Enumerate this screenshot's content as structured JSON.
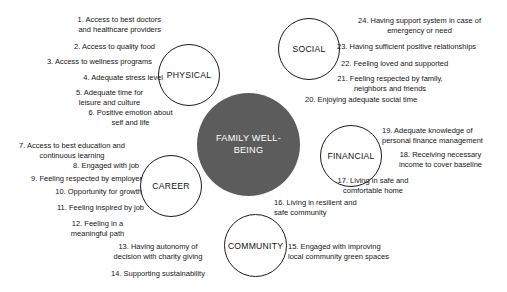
{
  "diagram": {
    "core": {
      "label": "FAMILY WELL-BEING",
      "color": "#5c5c5c",
      "text_color": "#ffffff"
    },
    "categories": [
      {
        "key": "physical",
        "label": "PHYSICAL"
      },
      {
        "key": "social",
        "label": "SOCIAL"
      },
      {
        "key": "financial",
        "label": "FINANCIAL"
      },
      {
        "key": "community",
        "label": "COMMUNITY"
      },
      {
        "key": "career",
        "label": "CAREER"
      }
    ],
    "items": [
      {
        "number": "1",
        "text": "1. Access to best doctors\nand healthcare providers",
        "category": "physical"
      },
      {
        "number": "2",
        "text": "2. Access to quality food",
        "category": "physical"
      },
      {
        "number": "3",
        "text": "3. Access to wellness programs",
        "category": "physical"
      },
      {
        "number": "4",
        "text": "4. Adequate stress level",
        "category": "physical"
      },
      {
        "number": "5",
        "text": "5. Adequate time for\nleisure and culture",
        "category": "physical"
      },
      {
        "number": "6",
        "text": "6. Positive emotion about\nself and life",
        "category": "physical"
      },
      {
        "number": "7",
        "text": "7. Access to best education and\ncontinuous learning",
        "category": "career"
      },
      {
        "number": "8",
        "text": "8. Engaged with job",
        "category": "career"
      },
      {
        "number": "9",
        "text": "9. Feeling respected by employer",
        "category": "career"
      },
      {
        "number": "10",
        "text": "10. Opportunity for growth",
        "category": "career"
      },
      {
        "number": "11",
        "text": "11. Feeling inspired by job",
        "category": "career"
      },
      {
        "number": "12",
        "text": "12. Feeling in a\nmeaningful path",
        "category": "career"
      },
      {
        "number": "13",
        "text": "13. Having autonomy of\ndecision with charity giving",
        "category": "community"
      },
      {
        "number": "14",
        "text": "14. Supporting sustainability",
        "category": "community"
      },
      {
        "number": "15",
        "text": "15. Engaged with improving\nlocal community green spaces",
        "category": "community"
      },
      {
        "number": "16",
        "text": "16. Living in resilient and\nsafe community",
        "category": "financial"
      },
      {
        "number": "17",
        "text": "17. Living in safe and\ncomfortable home",
        "category": "financial"
      },
      {
        "number": "18",
        "text": "18. Receiving necessary\nincome to cover baseline",
        "category": "financial"
      },
      {
        "number": "19",
        "text": "19. Adequate knowledge of\npersonal finance management",
        "category": "financial"
      },
      {
        "number": "20",
        "text": "20. Enjoying adequate social time",
        "category": "social"
      },
      {
        "number": "21",
        "text": "21. Feeling respected by family,\nneighbors and friends",
        "category": "social"
      },
      {
        "number": "22",
        "text": "22. Feeling loved and supported",
        "category": "social"
      },
      {
        "number": "23",
        "text": "23. Having sufficient positive relationships",
        "category": "social"
      },
      {
        "number": "24",
        "text": "24. Having support system in case of\nemergency or need",
        "category": "social"
      }
    ]
  }
}
